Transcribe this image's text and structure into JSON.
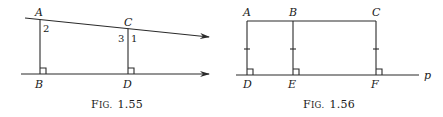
{
  "figures": [
    {
      "caption": "Fig. 1.55",
      "caption_prefix": "F",
      "caption_small": "IG.",
      "caption_num": "1.55",
      "points": {
        "A": "A",
        "B": "B",
        "C": "C",
        "D": "D"
      },
      "angles": {
        "a2": "2",
        "a3": "3",
        "a1": "1"
      }
    },
    {
      "caption": "Fig. 1.56",
      "caption_prefix": "F",
      "caption_small": "IG.",
      "caption_num": "1.56",
      "points": {
        "A": "A",
        "B": "B",
        "C": "C",
        "D": "D",
        "E": "E",
        "F": "F"
      },
      "line_label": "p"
    }
  ]
}
